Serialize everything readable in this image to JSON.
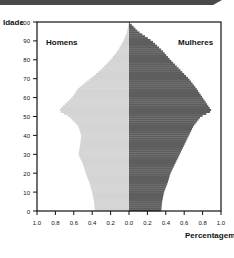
{
  "chart_data": {
    "type": "bar",
    "subtype": "population-pyramid",
    "title": "",
    "ylabel": "Idade",
    "xlabel": "Percentagem",
    "ylim": [
      0,
      100
    ],
    "xlim": [
      -1.0,
      1.0
    ],
    "y_ticks": [
      0,
      10,
      20,
      30,
      40,
      50,
      60,
      70,
      80,
      90,
      100
    ],
    "x_tick_labels": [
      "1.0",
      "0.8",
      "0.6",
      "0.4",
      "0.2",
      "0.0",
      "0.2",
      "0.4",
      "0.6",
      "0.8",
      "1.0"
    ],
    "legend": [
      "Homens",
      "Mulheres"
    ],
    "categories": [
      0,
      5,
      10,
      15,
      20,
      25,
      30,
      35,
      40,
      45,
      50,
      53,
      55,
      60,
      65,
      70,
      75,
      80,
      85,
      90,
      95,
      100
    ],
    "series": [
      {
        "name": "Homens",
        "color": "#d4d4d4",
        "values": [
          0.37,
          0.38,
          0.4,
          0.43,
          0.47,
          0.5,
          0.55,
          0.53,
          0.52,
          0.55,
          0.65,
          0.76,
          0.73,
          0.62,
          0.55,
          0.42,
          0.3,
          0.2,
          0.12,
          0.06,
          0.02,
          0.0
        ]
      },
      {
        "name": "Mulheres",
        "color": "#5e5e5e",
        "values": [
          0.35,
          0.36,
          0.38,
          0.42,
          0.45,
          0.5,
          0.55,
          0.6,
          0.65,
          0.7,
          0.78,
          0.9,
          0.87,
          0.8,
          0.73,
          0.65,
          0.55,
          0.45,
          0.36,
          0.25,
          0.1,
          0.0
        ]
      }
    ],
    "grid": false,
    "legend_position": "inside-top"
  },
  "labels": {
    "y_axis": "Idade",
    "x_axis": "Percentagem",
    "men": "Homens",
    "women": "Mulheres"
  }
}
